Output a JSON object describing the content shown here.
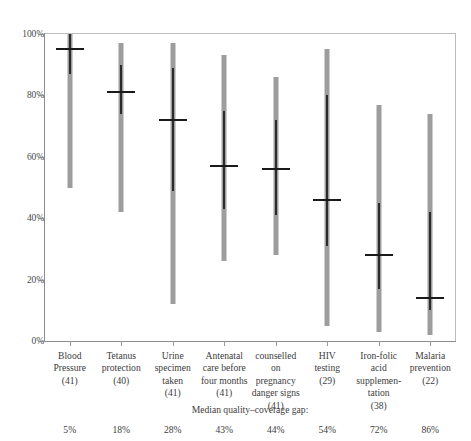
{
  "chart_data": {
    "type": "bar",
    "title": "",
    "subtitle": "",
    "xlabel": "",
    "ylabel": "",
    "ylim": [
      0,
      100
    ],
    "grid": false,
    "legend": null,
    "y_ticks": [
      "0%",
      "20%",
      "40%",
      "60%",
      "80%",
      "100%"
    ],
    "y_tick_values": [
      0,
      20,
      40,
      60,
      80,
      100
    ],
    "categories": [
      "Blood\nPressure\n(41)",
      "Tetanus\nprotection\n(40)",
      "Urine\nspecimen\ntaken\n(41)",
      "Antenatal\ncare before\nfour months\n(41)",
      "counselled\non\npregnancy\ndanger signs\n(41)",
      "HIV\ntesting\n(29)",
      "Iron-folic\nacid\nsupplemen-\ntation\n(38)",
      "Malaria\nprevention\n(22)"
    ],
    "category_names": [
      "Blood Pressure",
      "Tetanus protection",
      "Urine specimen taken",
      "Antenatal care before four months",
      "counselled on pregnancy danger signs",
      "HIV testing",
      "Iron-folic acid supplementation",
      "Malaria prevention"
    ],
    "category_counts": [
      41,
      40,
      41,
      41,
      41,
      29,
      38,
      22
    ],
    "series": [
      {
        "name": "full range",
        "low": [
          50,
          42,
          12,
          26,
          28,
          5,
          3,
          2
        ],
        "high": [
          100,
          97,
          97,
          93,
          86,
          95,
          77,
          74
        ]
      },
      {
        "name": "interquartile range",
        "low": [
          87,
          74,
          49,
          43,
          41,
          31,
          17,
          10
        ],
        "high": [
          100,
          90,
          89,
          75,
          72,
          80,
          45,
          42
        ]
      },
      {
        "name": "median",
        "values": [
          95,
          81,
          72,
          57,
          56,
          46,
          28,
          14
        ]
      }
    ],
    "annotations": {
      "gap_caption": "Median quality–coverage gap:",
      "gap_values": [
        "5%",
        "18%",
        "28%",
        "43%",
        "44%",
        "54%",
        "72%",
        "86%"
      ]
    },
    "colors": {
      "range_bar": "#9d9d9d",
      "iqr_bar": "#2b2b2b",
      "median_mark": "#1a1a1a",
      "axis": "#8d8d8d",
      "text": "#3d3d3d",
      "background": "#ffffff"
    }
  }
}
